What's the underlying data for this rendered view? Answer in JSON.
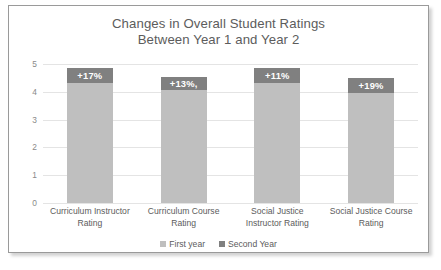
{
  "chart_data": {
    "type": "bar",
    "title": "Changes in Overall Student Ratings Between Year 1 and Year 2",
    "title_lines": [
      "Changes in Overall Student Ratings",
      "Between Year 1 and Year 2"
    ],
    "xlabel": "",
    "ylabel": "",
    "ylim": [
      0,
      5
    ],
    "yticks": [
      "5",
      "4",
      "3",
      "2",
      "1",
      "0"
    ],
    "grid": true,
    "legend_position": "bottom",
    "stacked": true,
    "categories": [
      "Curriculum Instructor Rating",
      "Curriculum Course Rating",
      "Social Justice Instructor Rating",
      "Social Justice Course Rating"
    ],
    "category_lines": [
      [
        "Curriculum Instructor",
        "Rating"
      ],
      [
        "Curriculum Course",
        "Rating"
      ],
      [
        "Social Justice",
        "Instructor Rating"
      ],
      [
        "Social Justice Course",
        "Rating"
      ]
    ],
    "series": [
      {
        "name": "First year",
        "color": "#bfbfbf",
        "values": [
          4.3,
          4.05,
          4.3,
          3.95
        ]
      },
      {
        "name": "Second Year",
        "color": "#808080",
        "values": [
          0.55,
          0.5,
          0.55,
          0.55
        ]
      }
    ],
    "data_labels": [
      "+17%",
      "+13%,",
      "+11%",
      "+19%"
    ]
  },
  "legend": {
    "items": [
      {
        "label": "First year",
        "color": "#bfbfbf"
      },
      {
        "label": "Second Year",
        "color": "#808080"
      }
    ]
  }
}
